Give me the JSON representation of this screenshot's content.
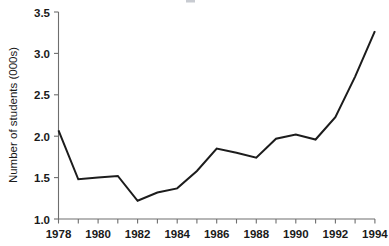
{
  "chart_data": {
    "type": "line",
    "title": "",
    "xlabel": "",
    "ylabel": "Number of students (000s)",
    "x": [
      1978,
      1979,
      1980,
      1981,
      1982,
      1983,
      1984,
      1985,
      1986,
      1987,
      1988,
      1989,
      1990,
      1991,
      1992,
      1993,
      1994
    ],
    "values": [
      2.07,
      1.48,
      1.5,
      1.52,
      1.22,
      1.32,
      1.37,
      1.58,
      1.85,
      1.8,
      1.74,
      1.97,
      2.02,
      1.96,
      2.23,
      2.72,
      3.27
    ],
    "series": [
      {
        "name": "Number of students",
        "values": [
          2.07,
          1.48,
          1.5,
          1.52,
          1.22,
          1.32,
          1.37,
          1.58,
          1.85,
          1.8,
          1.74,
          1.97,
          2.02,
          1.96,
          2.23,
          2.72,
          3.27
        ]
      }
    ],
    "xlim": [
      1978,
      1994
    ],
    "ylim": [
      1.0,
      3.5
    ],
    "x_ticks_all": [
      1978,
      1979,
      1980,
      1981,
      1982,
      1983,
      1984,
      1985,
      1986,
      1987,
      1988,
      1989,
      1990,
      1991,
      1992,
      1993,
      1994
    ],
    "xticklabels": [
      "1978",
      "1980",
      "1982",
      "1984",
      "1986",
      "1988",
      "1990",
      "1992",
      "1994"
    ],
    "xtick_label_values": [
      1978,
      1980,
      1982,
      1984,
      1986,
      1988,
      1990,
      1992,
      1994
    ],
    "yticks": [
      1.0,
      1.5,
      2.0,
      2.5,
      3.0,
      3.5
    ],
    "yticklabels": [
      "1.0",
      "1.5",
      "2.0",
      "2.5",
      "3.0",
      "3.5"
    ],
    "grid": false,
    "legend": false,
    "line_color": "#1c1c1c",
    "axis_color": "#6e6e6e",
    "background_color": "#ffffff"
  },
  "axes": {
    "y_label": "Number of students (000s)",
    "y_tick_labels": [
      "3.5",
      "3.0",
      "2.5",
      "2.0",
      "1.5",
      "1.0"
    ],
    "x_tick_labels": [
      "1978",
      "1980",
      "1982",
      "1984",
      "1986",
      "1988",
      "1990",
      "1992",
      "1994"
    ]
  }
}
